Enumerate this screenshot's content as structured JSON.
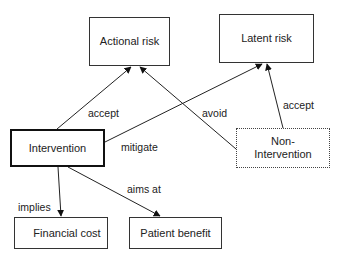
{
  "diagram": {
    "nodes": {
      "actional_risk": "Actional risk",
      "latent_risk": "Latent risk",
      "intervention": "Intervention",
      "non_intervention": "Non-\nIntervention",
      "financial_cost": "Financial cost",
      "patient_benefit": "Patient benefit"
    },
    "edges": [
      {
        "from": "Intervention",
        "to": "Actional risk",
        "label": "accept"
      },
      {
        "from": "Intervention",
        "to": "Latent risk",
        "label": "mitigate"
      },
      {
        "from": "Non-Intervention",
        "to": "Actional risk",
        "label": "avoid"
      },
      {
        "from": "Non-Intervention",
        "to": "Latent risk",
        "label": "accept"
      },
      {
        "from": "Intervention",
        "to": "Financial cost",
        "label": "implies"
      },
      {
        "from": "Intervention",
        "to": "Patient benefit",
        "label": "aims at"
      }
    ],
    "labels": {
      "accept_actional": "accept",
      "mitigate": "mitigate",
      "avoid": "avoid",
      "accept_latent": "accept",
      "implies": "implies",
      "aims_at": "aims at"
    }
  }
}
